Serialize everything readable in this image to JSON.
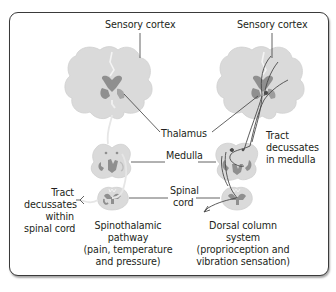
{
  "diagram": {
    "colors": {
      "tissue": "#d9d9d9",
      "tissue_outline": "#cfcfcf",
      "gray_matter": "#8f8f8f",
      "tract_line": "#4a4a4a",
      "leader_line": "#3c3c3c",
      "frame_border": "#3a3a3a"
    },
    "left_panel": {
      "top_label": "Sensory cortex",
      "caption_line1": "Spinothalamic",
      "caption_line2": "pathway",
      "caption_line3": "(pain, temperature",
      "caption_line4": "and pressure)",
      "side_label_line1": "Tract",
      "side_label_line2": "decussates",
      "side_label_line3": "within",
      "side_label_line4": "spinal cord"
    },
    "right_panel": {
      "top_label": "Sensory cortex",
      "side_label_line1": "Tract",
      "side_label_line2": "decussates",
      "side_label_line3": "in medulla",
      "caption_line1": "Dorsal column",
      "caption_line2": "system",
      "caption_line3": "(proprioception and",
      "caption_line4": "vibration sensation)"
    },
    "center_labels": {
      "thalamus": "Thalamus",
      "medulla": "Medulla",
      "spinal_cord_line1": "Spinal",
      "spinal_cord_line2": "cord"
    }
  }
}
